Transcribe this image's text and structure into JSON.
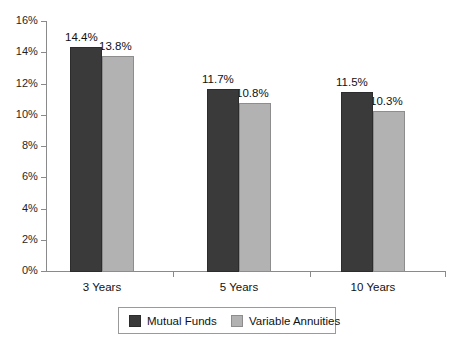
{
  "chart_data": {
    "type": "bar",
    "title": "",
    "subtitle": "",
    "xlabel": "",
    "ylabel": "",
    "categories": [
      "3 Years",
      "5 Years",
      "10 Years"
    ],
    "series": [
      {
        "name": "Mutual Funds",
        "color": "#3a3a3a",
        "values": [
          14.4,
          11.7,
          11.5
        ],
        "labels": [
          "14.4%",
          "11.7%",
          "11.5%"
        ]
      },
      {
        "name": "Variable Annuities",
        "color": "#b2b2b2",
        "values": [
          13.8,
          10.8,
          10.3
        ],
        "labels": [
          "13.8%",
          "10.8%",
          "10.3%"
        ]
      }
    ],
    "ylim": [
      0,
      16
    ],
    "ytick_values": [
      0,
      2,
      4,
      6,
      8,
      10,
      12,
      14,
      16
    ],
    "ytick_labels": [
      "0%",
      "2%",
      "4%",
      "6%",
      "8%",
      "10%",
      "12%",
      "14%",
      "16%"
    ],
    "grid": false,
    "legend_position": "bottom",
    "axis_color": "#8a8a8a"
  },
  "legend": {
    "entries": [
      {
        "label": "Mutual Funds",
        "swatch": "dark"
      },
      {
        "label": "Variable Annuities",
        "swatch": "light"
      }
    ]
  }
}
